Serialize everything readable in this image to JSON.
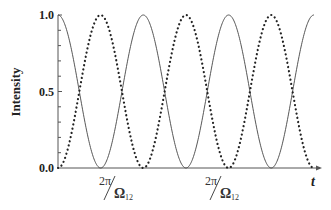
{
  "chart_data": {
    "type": "line",
    "title": "",
    "xlabel": "t",
    "ylabel": "Intensity",
    "ylim": [
      0.0,
      1.0
    ],
    "yticks": [
      "0.0",
      "0.5",
      "1.0"
    ],
    "xtick_labels": [
      {
        "numerator": "2π",
        "denominator": "Ω",
        "subscript": "12"
      },
      {
        "numerator": "2π",
        "denominator": "Ω",
        "subscript": "12"
      }
    ],
    "grid": false,
    "legend": null,
    "period_label": "2π/Ω12",
    "series": [
      {
        "name": "solid",
        "style": "solid",
        "function": "cos^2(Ω12 t / 2)",
        "start": 1.0,
        "x_periods": [
          0,
          0.5,
          1,
          1.5,
          2,
          2.5,
          3
        ],
        "values": [
          1.0,
          0.0,
          1.0,
          0.0,
          1.0,
          0.0,
          1.0
        ]
      },
      {
        "name": "dotted",
        "style": "dotted",
        "function": "sin^2(Ω12 t / 2)",
        "start": 0.0,
        "x_periods": [
          0,
          0.5,
          1,
          1.5,
          2,
          2.5,
          3
        ],
        "values": [
          0.0,
          1.0,
          0.0,
          1.0,
          0.0,
          1.0,
          0.0
        ]
      }
    ]
  },
  "axis": {
    "y_title": "Intensity",
    "x_title": "t",
    "y_ticks": {
      "top": "1.0",
      "mid": "0.5",
      "bottom": "0.0"
    },
    "x_period_1": {
      "num": "2π",
      "den": "Ω",
      "sub": "12"
    },
    "x_period_2": {
      "num": "2π",
      "den": "Ω",
      "sub": "12"
    }
  }
}
